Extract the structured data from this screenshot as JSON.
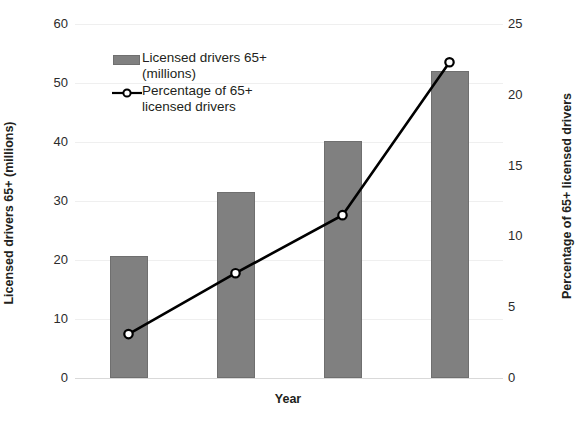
{
  "chart_data": {
    "type": "bar",
    "title": "",
    "xlabel": "Year",
    "ylabel": "Licensed drivers 65+ (millions)",
    "y2label": "Percentage of 65+ licensed drivers",
    "categories": [
      "",
      "",
      "",
      ""
    ],
    "grid": true,
    "legend_position": "inside-top-left",
    "ylim": [
      0,
      60
    ],
    "y2lim": [
      0,
      25
    ],
    "yticks": [
      "0",
      "10",
      "20",
      "30",
      "40",
      "50",
      "60"
    ],
    "ytick_values": [
      0,
      10,
      20,
      30,
      40,
      50,
      60
    ],
    "y2ticks": [
      "0",
      "5",
      "10",
      "15",
      "20",
      "25"
    ],
    "y2tick_values": [
      0,
      5,
      10,
      15,
      20,
      25
    ],
    "series": [
      {
        "name": "Licensed drivers 65+ (millions)",
        "type": "bar",
        "axis": "left",
        "color": "#808080",
        "values": [
          20.7,
          31.6,
          40.1,
          52.0
        ]
      },
      {
        "name": "Percentage of 65+ licensed drivers",
        "type": "line",
        "axis": "right",
        "color": "#000000",
        "marker": "circle-open",
        "values": [
          3.1,
          7.4,
          11.5,
          22.3
        ]
      }
    ]
  },
  "legend": {
    "items": [
      {
        "label_line1": "Licensed drivers 65+",
        "label_line2": "(millions)",
        "symbol": "bar-swatch-icon"
      },
      {
        "label_line1": "Percentage of 65+",
        "label_line2": "licensed drivers",
        "symbol": "line-marker-icon"
      }
    ]
  }
}
